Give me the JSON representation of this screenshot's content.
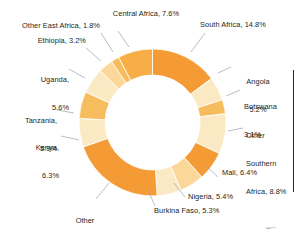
{
  "chart_data": {
    "type": "pie",
    "variant": "donut",
    "title": "",
    "subtitle": "",
    "xlabel": "",
    "ylabel": "",
    "units": "percent",
    "total": 100.0,
    "start_angle_deg": 0,
    "direction": "clockwise",
    "legend_position": "callout-labels",
    "grid": false,
    "categories": [
      "South Africa",
      "Angola",
      "Botswana",
      "Other Southern Africa",
      "Mali",
      "Nigeria",
      "Burkina Faso",
      "Other West Africa",
      "Kenya",
      "Tanzania",
      "Uganda",
      "Ethiopia",
      "Other East Africa",
      "Central Africa"
    ],
    "values": [
      14.8,
      5.2,
      3.1,
      8.8,
      6.4,
      5.4,
      5.3,
      20.6,
      6.3,
      5.9,
      5.6,
      3.2,
      1.8,
      7.6
    ],
    "colors": [
      "#F59B35",
      "#FBE9C4",
      "#F7BC5E",
      "#FBE9C4",
      "#F59B35",
      "#FBD89A",
      "#FBE9C4",
      "#F59B35",
      "#FBE9C4",
      "#F7BC5E",
      "#FBE9C4",
      "#FBD89A",
      "#F7BC5E",
      "#F7AE47"
    ],
    "slices": [
      {
        "label": "South Africa",
        "value": 14.8,
        "display": "South Africa, 14.8%",
        "color": "#F59B35"
      },
      {
        "label": "Angola",
        "value": 5.2,
        "display": "Angola 5.2%",
        "color": "#FBE9C4"
      },
      {
        "label": "Botswana",
        "value": 3.1,
        "display": "Botswana 3.1%",
        "color": "#F7BC5E"
      },
      {
        "label": "Other Southern Africa",
        "value": 8.8,
        "display": "Other Southern Africa, 8.8%",
        "color": "#FBE9C4"
      },
      {
        "label": "Mali",
        "value": 6.4,
        "display": "Mali, 6.4%",
        "color": "#F59B35"
      },
      {
        "label": "Nigeria",
        "value": 5.4,
        "display": "Nigeria, 5.4%",
        "color": "#FBD89A"
      },
      {
        "label": "Burkina Faso",
        "value": 5.3,
        "display": "Burkina Faso, 5.3%",
        "color": "#FBE9C4"
      },
      {
        "label": "Other West Africa",
        "value": 20.6,
        "display": "Other West Africa, 20.6%",
        "color": "#F59B35"
      },
      {
        "label": "Kenya",
        "value": 6.3,
        "display": "Kenya, 6.3%",
        "color": "#FBE9C4"
      },
      {
        "label": "Tanzania",
        "value": 5.9,
        "display": "Tanzania, 5.9%",
        "color": "#F7BC5E"
      },
      {
        "label": "Uganda",
        "value": 5.6,
        "display": "Uganda, 5.6%",
        "color": "#FBE9C4"
      },
      {
        "label": "Ethiopia",
        "value": 3.2,
        "display": "Ethiopia, 3.2%",
        "color": "#FBD89A"
      },
      {
        "label": "Other East Africa",
        "value": 1.8,
        "display": "Other East Africa, 1.8%",
        "color": "#F7BC5E"
      },
      {
        "label": "Central Africa",
        "value": 7.6,
        "display": "Central Africa, 7.6%",
        "color": "#F7AE47"
      }
    ]
  },
  "labels": {
    "central_africa": "Central Africa, 7.6%",
    "south_africa": "South Africa, 14.8%",
    "other_east_africa": "Other East Africa, 1.8%",
    "ethiopia": "Ethiopia, 3.2%",
    "uganda_line1": "Uganda,",
    "uganda_line2": "5.6%",
    "tanzania_line1": "Tanzania,",
    "tanzania_line2": "5.9%",
    "kenya_line1": "Kenya,",
    "kenya_line2": "6.3%",
    "other_west_africa_line1": "Other",
    "other_west_africa_line2": "West Africa, 20.6%",
    "burkina_faso": "Burkina Faso, 5.3%",
    "nigeria": "Nigeria, 5.4%",
    "mali": "Mali, 6.4%",
    "other_southern_line1": "Other",
    "other_southern_line2": "Southern",
    "other_southern_line3": "Africa, 8.8%",
    "botswana_line1": "Botswana",
    "botswana_line2": "3.1%",
    "angola_line1": "Angola",
    "angola_line2": "5.2%"
  },
  "colors": {
    "dark_orange": "#F59B35",
    "mid_orange": "#F7AE47",
    "light_orange": "#F7BC5E",
    "pale_orange": "#FBD89A",
    "cream": "#FBE9C4",
    "text": "#231f20",
    "leader_line": "#9aa4ae",
    "page_rule": "#1b2a3a"
  }
}
